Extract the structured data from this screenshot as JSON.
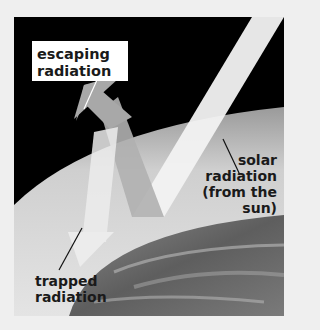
{
  "diagram": {
    "labels": {
      "escaping": "escaping radiation",
      "escaping_line1": "escaping",
      "escaping_line2": "radiation",
      "solar_line1": "solar",
      "solar_line2": "radiation",
      "solar_line3": "(from the",
      "solar_line4": "sun)",
      "trapped_line1": "trapped",
      "trapped_line2": "radiation"
    },
    "colors": {
      "background": "#efefef",
      "space": "#000000",
      "atmosphere": "#bdbdbd",
      "earth": "#6e6e6e",
      "beam": "#f2f2f2",
      "arrow": "#a8a8a8"
    }
  }
}
